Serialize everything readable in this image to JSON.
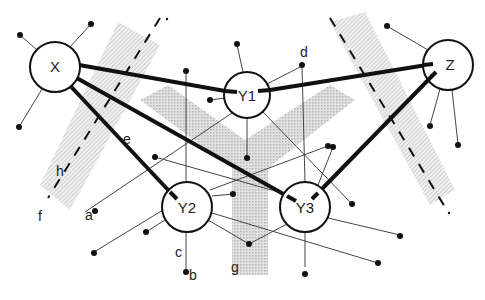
{
  "diagram": {
    "nodes": [
      {
        "id": "X",
        "label": "X",
        "cx": 55,
        "cy": 67,
        "r": 25
      },
      {
        "id": "Y1",
        "label": "Y1",
        "cx": 247,
        "cy": 95,
        "r": 23
      },
      {
        "id": "Z",
        "label": "Z",
        "cx": 448,
        "cy": 65,
        "r": 25
      },
      {
        "id": "Y2",
        "label": "Y2",
        "cx": 187,
        "cy": 207,
        "r": 25
      },
      {
        "id": "Y3",
        "label": "Y3",
        "cx": 305,
        "cy": 207,
        "r": 25
      }
    ],
    "labels": {
      "a": "a",
      "b": "b",
      "c": "c",
      "d": "d",
      "e": "e",
      "f": "f",
      "g": "g",
      "h": "h"
    },
    "colors": {
      "stroke": "#111111",
      "thin_line": "#444444",
      "band_fill": "#cfcfcf"
    }
  }
}
